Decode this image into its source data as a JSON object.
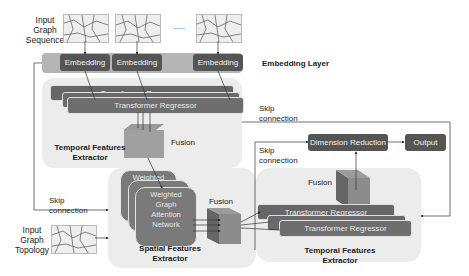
{
  "input_sequence": {
    "label_lines": [
      "Input",
      "Graph",
      "Sequence"
    ],
    "ellipsis": "......"
  },
  "embedding_layer": {
    "label": "Embedding Layer",
    "blocks": [
      "Embedding",
      "Embedding",
      "Embedding"
    ]
  },
  "temporal_top": {
    "regressors": [
      "Transformer Regressor",
      "Transformer Regressor"
    ],
    "title_lines": [
      "Temporal Features",
      "Extractor"
    ],
    "fusion_label": "Fusion"
  },
  "skip_connections": {
    "top": [
      "Skip",
      "connection"
    ],
    "left": [
      "Skip",
      "connection"
    ],
    "right": [
      "Skip",
      "connection"
    ]
  },
  "spatial": {
    "back_label": "Weighted",
    "front_label_lines": [
      "Weighted",
      "Graph",
      "Attention",
      "Network"
    ],
    "title_lines": [
      "Spatial Features",
      "Extractor"
    ],
    "fusion_label": "Fusion"
  },
  "input_topology": {
    "label_lines": [
      "Input",
      "Graph",
      "Topology"
    ]
  },
  "temporal_bottom": {
    "regressors": [
      "Transformer Regressor",
      "Transformer Regressor"
    ],
    "title_lines": [
      "Temporal Features",
      "Extractor"
    ],
    "fusion_label": "Fusion"
  },
  "output_stage": {
    "dimension_reduction": "Dimension Reduction",
    "output": "Output"
  },
  "colors": {
    "panel": "#ececec",
    "dark_box": "#555555",
    "regressor": "#6e6e6e",
    "fusion_block": "#8a8a8a",
    "embedding_band": "#b0b0b0"
  }
}
